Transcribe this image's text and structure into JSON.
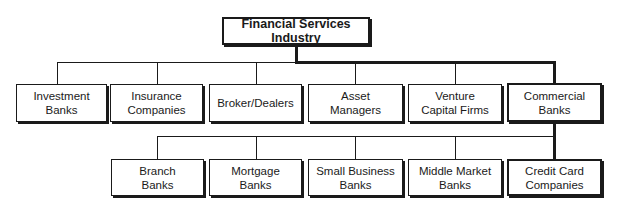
{
  "diagram": {
    "type": "org-chart",
    "root": {
      "label": "Financial Services Industry"
    },
    "level1": [
      {
        "label": "Investment Banks"
      },
      {
        "label": "Insurance\nCompanies"
      },
      {
        "label": "Broker/Dealers"
      },
      {
        "label": "Asset\nManagers"
      },
      {
        "label": "Venture\nCapital Firms"
      },
      {
        "label": "Commercial Banks",
        "highlighted": true
      }
    ],
    "level2_parent": "Commercial Banks",
    "level2": [
      {
        "label": "Branch\nBanks"
      },
      {
        "label": "Mortgage\nBanks"
      },
      {
        "label": "Small Business\nBanks"
      },
      {
        "label": "Middle Market\nBanks"
      },
      {
        "label": "Credit Card\nCompanies",
        "highlighted": true
      }
    ],
    "highlighted_path": [
      "Financial Services Industry",
      "Commercial Banks",
      "Credit Card Companies"
    ],
    "colors": {
      "line": "#1a1a1a",
      "background": "#ffffff"
    }
  }
}
